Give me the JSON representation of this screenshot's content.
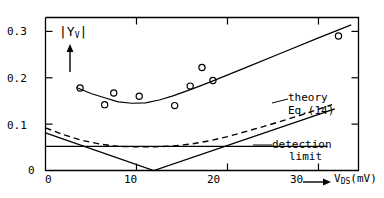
{
  "chart_data": {
    "type": "scatter",
    "title": "",
    "xlabel": "V_DS (mV)",
    "xlabel_main": "V",
    "xlabel_sub": "DS",
    "xlabel_unit": "(mV)",
    "ylabel": "|Y_V|",
    "ylabel_main": "|Y",
    "ylabel_sub": "V",
    "ylabel_close": "|",
    "xlim": [
      0,
      34.4
    ],
    "ylim": [
      0,
      0.33
    ],
    "xticks": [
      0,
      10,
      20,
      30
    ],
    "xtick_labels": [
      "0",
      "10",
      "20",
      "30"
    ],
    "yticks": [
      0,
      0.1,
      0.2,
      0.3
    ],
    "ytick_labels": [
      "0",
      "0.1",
      "0.2",
      "0.3"
    ],
    "grid": false,
    "legend_position": "inline-annotations",
    "series": [
      {
        "name": "measured data",
        "style": "open-circle-markers",
        "points": [
          {
            "x": 3.8,
            "y": 0.178
          },
          {
            "x": 6.5,
            "y": 0.142
          },
          {
            "x": 7.5,
            "y": 0.167
          },
          {
            "x": 10.3,
            "y": 0.16
          },
          {
            "x": 14.2,
            "y": 0.14
          },
          {
            "x": 15.9,
            "y": 0.182
          },
          {
            "x": 17.2,
            "y": 0.222
          },
          {
            "x": 18.4,
            "y": 0.194
          },
          {
            "x": 32.2,
            "y": 0.29
          }
        ]
      },
      {
        "name": "fit through data",
        "style": "solid-curve",
        "points": [
          {
            "x": 3.4,
            "y": 0.179
          },
          {
            "x": 5.0,
            "y": 0.166
          },
          {
            "x": 6.5,
            "y": 0.157
          },
          {
            "x": 8.0,
            "y": 0.148
          },
          {
            "x": 9.5,
            "y": 0.145
          },
          {
            "x": 11.0,
            "y": 0.146
          },
          {
            "x": 12.5,
            "y": 0.152
          },
          {
            "x": 14.0,
            "y": 0.161
          },
          {
            "x": 16.0,
            "y": 0.175
          },
          {
            "x": 18.0,
            "y": 0.19
          },
          {
            "x": 22.0,
            "y": 0.222
          },
          {
            "x": 26.0,
            "y": 0.254
          },
          {
            "x": 30.0,
            "y": 0.286
          },
          {
            "x": 33.6,
            "y": 0.314
          }
        ]
      },
      {
        "name": "theory",
        "style": "dashed-curve",
        "points": [
          {
            "x": 0.0,
            "y": 0.092
          },
          {
            "x": 2.0,
            "y": 0.077
          },
          {
            "x": 4.0,
            "y": 0.065
          },
          {
            "x": 6.0,
            "y": 0.057
          },
          {
            "x": 8.0,
            "y": 0.052
          },
          {
            "x": 10.0,
            "y": 0.051
          },
          {
            "x": 12.0,
            "y": 0.051
          },
          {
            "x": 14.0,
            "y": 0.053
          },
          {
            "x": 16.0,
            "y": 0.057
          },
          {
            "x": 18.0,
            "y": 0.064
          },
          {
            "x": 20.0,
            "y": 0.073
          },
          {
            "x": 24.0,
            "y": 0.095
          },
          {
            "x": 28.0,
            "y": 0.119
          },
          {
            "x": 31.5,
            "y": 0.142
          }
        ]
      },
      {
        "name": "Eq.(14)",
        "style": "solid-v-line",
        "points": [
          {
            "x": 0.0,
            "y": 0.081
          },
          {
            "x": 11.9,
            "y": 0.0
          },
          {
            "x": 31.8,
            "y": 0.133
          }
        ]
      },
      {
        "name": "detection limit",
        "style": "solid-horizontal-line",
        "points": [
          {
            "x": 0.0,
            "y": 0.052
          },
          {
            "x": 31.0,
            "y": 0.052
          }
        ]
      }
    ],
    "annotations": [
      {
        "id": "theory-label",
        "text": "theory",
        "x": 24.5,
        "y": 0.175
      },
      {
        "id": "eq14-label",
        "text": "Eq.(14)",
        "x": 24.5,
        "y": 0.152
      },
      {
        "id": "detection-label-1",
        "text": "detection",
        "x": 25.0,
        "y": 0.06
      },
      {
        "id": "detection-label-2",
        "text": "limit",
        "x": 26.5,
        "y": 0.038
      }
    ],
    "marker_color": "#000000",
    "line_color": "#000000",
    "background_color": "#ffffff",
    "axis_color": "#000000"
  },
  "labels": {
    "theory": "theory",
    "eq14": "Eq.(14)",
    "detection": "detection",
    "limit": "limit",
    "y0": "0",
    "y1": "0.1",
    "y2": "0.2",
    "y3": "0.3",
    "x0": "0",
    "x1": "10",
    "x2": "20",
    "x3": "30",
    "x_axis_main": "V",
    "x_axis_sub": "DS",
    "x_axis_unit": "(mV)",
    "y_axis_open": "|Y",
    "y_axis_sub": "V",
    "y_axis_close": "|"
  }
}
